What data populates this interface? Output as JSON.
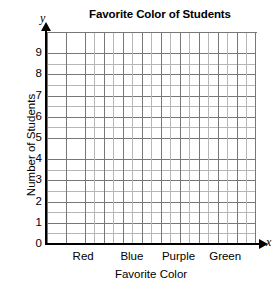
{
  "chart_data": {
    "type": "bar",
    "title": "Favorite Color of Students",
    "xlabel": "Favorite Color",
    "ylabel": "Number of Students",
    "axis_letters": {
      "x": "x",
      "y": "y"
    },
    "categories": [
      "Red",
      "Blue",
      "Purple",
      "Green"
    ],
    "values": [
      null,
      null,
      null,
      null
    ],
    "series": [
      {
        "name": "Number of Students",
        "values": [
          null,
          null,
          null,
          null
        ]
      }
    ],
    "ylim": [
      0,
      10
    ],
    "yticks": [
      9,
      8,
      7,
      6,
      5,
      4,
      3,
      2,
      1,
      0
    ],
    "ytick_labels": [
      "9",
      "8",
      "7",
      "6",
      "5",
      "4",
      "3",
      "2",
      "1",
      "0"
    ],
    "y_minor_divisions_per_unit": 2,
    "grid": true,
    "grid_columns": 22,
    "grid_rows": 20,
    "legend": null,
    "legend_position": "none",
    "annotations": [],
    "note": "Blank grid; no bars plotted",
    "colors": {
      "axis": "#000000",
      "grid_major": "#777777",
      "grid_minor": "#b6b6b6",
      "background": "#ffffff",
      "text": "#000000"
    }
  },
  "category_positions_pct": [
    18,
    41,
    63,
    85
  ]
}
